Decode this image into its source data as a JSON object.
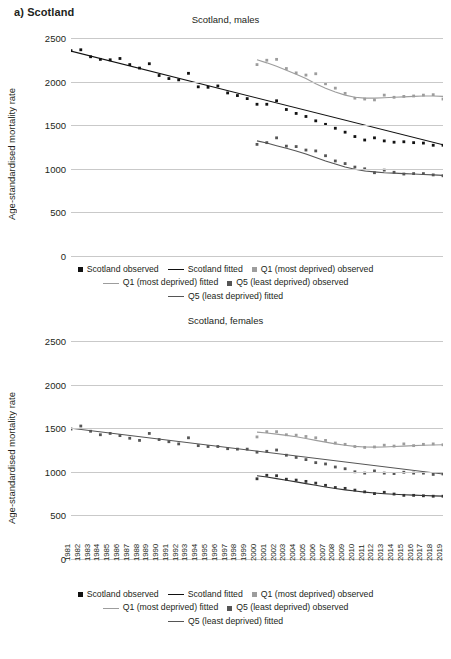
{
  "panel": {
    "label": "a) Scotland"
  },
  "colors": {
    "scotland": "#111111",
    "q1": "#9d9d9d",
    "q5": "#555555",
    "grid": "#c9c9c9",
    "text": "#231f20"
  },
  "axis": {
    "y_label": "Age-standardised mortality rate",
    "y_ticks": [
      "2500",
      "2000",
      "1500",
      "1000",
      "500",
      "0"
    ],
    "x_ticks": [
      "1981",
      "1982",
      "1983",
      "1984",
      "1985",
      "1986",
      "1987",
      "1988",
      "1989",
      "1990",
      "1991",
      "1992",
      "1993",
      "1994",
      "1995",
      "1996",
      "1997",
      "1998",
      "1999",
      "2000",
      "2001",
      "2002",
      "2003",
      "2004",
      "2005",
      "2006",
      "2007",
      "2008",
      "2009",
      "2010",
      "2011",
      "2012",
      "2013",
      "2014",
      "2015",
      "2016",
      "2017",
      "2018",
      "2019"
    ]
  },
  "legend": {
    "row1": [
      {
        "marker": "square",
        "series": "scotland",
        "label": "Scotland observed"
      },
      {
        "marker": "line",
        "series": "scotland",
        "label": "Scotland fitted"
      },
      {
        "marker": "square",
        "series": "q1",
        "label": "Q1 (most deprived) observed"
      }
    ],
    "row2": [
      {
        "marker": "line",
        "series": "q1",
        "label": "Q1 (most deprived) fitted"
      },
      {
        "marker": "square",
        "series": "q5",
        "label": "Q5 (least deprived) observed"
      }
    ],
    "row3": [
      {
        "marker": "line",
        "series": "q5",
        "label": "Q5 (least deprived) fitted"
      }
    ]
  },
  "chart_data": [
    {
      "type": "scatter",
      "id": "males",
      "title": "Scotland, males",
      "xlabel": "",
      "ylabel": "Age-standardised mortality rate",
      "ylim": [
        0,
        2500
      ],
      "grid": true,
      "legend_position": "below",
      "x": [
        1981,
        1982,
        1983,
        1984,
        1985,
        1986,
        1987,
        1988,
        1989,
        1990,
        1991,
        1992,
        1993,
        1994,
        1995,
        1996,
        1997,
        1998,
        1999,
        2000,
        2001,
        2002,
        2003,
        2004,
        2005,
        2006,
        2007,
        2008,
        2009,
        2010,
        2011,
        2012,
        2013,
        2014,
        2015,
        2016,
        2017,
        2018,
        2019
      ],
      "series": [
        {
          "name": "Scotland observed",
          "style": "points",
          "color": "#111111",
          "x": [
            1981,
            1982,
            1983,
            1984,
            1985,
            1986,
            1987,
            1988,
            1989,
            1990,
            1991,
            1992,
            1993,
            1994,
            1995,
            1996,
            1997,
            1998,
            1999,
            2000,
            2001,
            2002,
            2003,
            2004,
            2005,
            2006,
            2007,
            2008,
            2009,
            2010,
            2011,
            2012,
            2013,
            2014,
            2015,
            2016,
            2017,
            2018,
            2019
          ],
          "values": [
            2355,
            2365,
            2285,
            2255,
            2250,
            2265,
            2195,
            2155,
            2205,
            2070,
            2035,
            2020,
            2095,
            1940,
            1935,
            1950,
            1870,
            1840,
            1805,
            1740,
            1740,
            1780,
            1680,
            1635,
            1600,
            1550,
            1510,
            1465,
            1420,
            1370,
            1330,
            1355,
            1320,
            1305,
            1310,
            1300,
            1295,
            1270,
            1270
          ]
        },
        {
          "name": "Scotland fitted",
          "style": "line",
          "color": "#111111",
          "x": [
            1981,
            2019
          ],
          "values": [
            2350,
            1275
          ]
        },
        {
          "name": "Q1 (most deprived) observed",
          "style": "points",
          "color": "#9d9d9d",
          "x": [
            2000,
            2001,
            2002,
            2003,
            2004,
            2005,
            2006,
            2007,
            2008,
            2009,
            2010,
            2011,
            2012,
            2013,
            2014,
            2015,
            2016,
            2017,
            2018,
            2019
          ],
          "values": [
            2195,
            2245,
            2255,
            2150,
            2100,
            2075,
            2090,
            1975,
            1925,
            1865,
            1810,
            1800,
            1790,
            1845,
            1820,
            1830,
            1835,
            1845,
            1850,
            1800
          ]
        },
        {
          "name": "Q1 (most deprived) fitted",
          "style": "line",
          "color": "#9d9d9d",
          "x": [
            2000,
            2001,
            2002,
            2003,
            2004,
            2005,
            2006,
            2007,
            2008,
            2009,
            2010,
            2011,
            2012,
            2013,
            2014,
            2015,
            2016,
            2017,
            2018,
            2019
          ],
          "values": [
            2250,
            2215,
            2175,
            2130,
            2085,
            2035,
            1975,
            1925,
            1880,
            1845,
            1820,
            1810,
            1810,
            1815,
            1820,
            1825,
            1830,
            1835,
            1835,
            1830
          ]
        },
        {
          "name": "Q5 (least deprived) observed",
          "style": "points",
          "color": "#555555",
          "x": [
            2000,
            2001,
            2002,
            2003,
            2004,
            2005,
            2006,
            2007,
            2008,
            2009,
            2010,
            2011,
            2012,
            2013,
            2014,
            2015,
            2016,
            2017,
            2018,
            2019
          ],
          "values": [
            1280,
            1300,
            1355,
            1260,
            1255,
            1215,
            1205,
            1150,
            1090,
            1060,
            1020,
            1000,
            955,
            985,
            960,
            940,
            945,
            945,
            930,
            920
          ]
        },
        {
          "name": "Q5 (least deprived) fitted",
          "style": "line",
          "color": "#555555",
          "x": [
            2000,
            2001,
            2002,
            2003,
            2004,
            2005,
            2006,
            2007,
            2008,
            2009,
            2010,
            2011,
            2012,
            2013,
            2014,
            2015,
            2016,
            2017,
            2018,
            2019
          ],
          "values": [
            1320,
            1295,
            1265,
            1235,
            1205,
            1170,
            1130,
            1090,
            1055,
            1020,
            995,
            975,
            965,
            955,
            950,
            945,
            940,
            935,
            930,
            925
          ]
        }
      ]
    },
    {
      "type": "scatter",
      "id": "females",
      "title": "Scotland, females",
      "xlabel": "",
      "ylabel": "Age-standardised mortality rate",
      "ylim": [
        0,
        2500
      ],
      "grid": true,
      "legend_position": "below",
      "x": [
        1981,
        1982,
        1983,
        1984,
        1985,
        1986,
        1987,
        1988,
        1989,
        1990,
        1991,
        1992,
        1993,
        1994,
        1995,
        1996,
        1997,
        1998,
        1999,
        2000,
        2001,
        2002,
        2003,
        2004,
        2005,
        2006,
        2007,
        2008,
        2009,
        2010,
        2011,
        2012,
        2013,
        2014,
        2015,
        2016,
        2017,
        2018,
        2019
      ],
      "series": [
        {
          "name": "Scotland observed",
          "style": "points",
          "color": "#555555",
          "x": [
            1981,
            1982,
            1983,
            1984,
            1985,
            1986,
            1987,
            1988,
            1989,
            1990,
            1991,
            1992,
            1993,
            1994,
            1995,
            1996,
            1997,
            1998,
            1999,
            2000,
            2001,
            2002,
            2003,
            2004,
            2005,
            2006,
            2007,
            2008,
            2009,
            2010,
            2011,
            2012,
            2013,
            2014,
            2015,
            2016,
            2017,
            2018,
            2019
          ],
          "values": [
            1490,
            1525,
            1465,
            1425,
            1440,
            1415,
            1385,
            1360,
            1440,
            1370,
            1345,
            1320,
            1390,
            1300,
            1290,
            1290,
            1265,
            1260,
            1260,
            1225,
            1235,
            1250,
            1190,
            1165,
            1140,
            1105,
            1090,
            1055,
            1035,
            1000,
            985,
            1010,
            985,
            980,
            995,
            985,
            985,
            970,
            975
          ]
        },
        {
          "name": "Scotland fitted",
          "style": "line",
          "color": "#555555",
          "x": [
            1981,
            2019
          ],
          "values": [
            1500,
            975
          ]
        },
        {
          "name": "Q1 (most deprived) observed",
          "style": "points",
          "color": "#9d9d9d",
          "x": [
            2000,
            2001,
            2002,
            2003,
            2004,
            2005,
            2006,
            2007,
            2008,
            2009,
            2010,
            2011,
            2012,
            2013,
            2014,
            2015,
            2016,
            2017,
            2018,
            2019
          ],
          "values": [
            1400,
            1460,
            1460,
            1425,
            1420,
            1405,
            1390,
            1360,
            1330,
            1315,
            1290,
            1280,
            1285,
            1305,
            1295,
            1320,
            1300,
            1315,
            1320,
            1310
          ]
        },
        {
          "name": "Q1 (most deprived) fitted",
          "style": "line",
          "color": "#9d9d9d",
          "x": [
            2000,
            2001,
            2002,
            2003,
            2004,
            2005,
            2006,
            2007,
            2008,
            2009,
            2010,
            2011,
            2012,
            2013,
            2014,
            2015,
            2016,
            2017,
            2018,
            2019
          ],
          "values": [
            1455,
            1445,
            1432,
            1418,
            1402,
            1382,
            1360,
            1340,
            1320,
            1305,
            1292,
            1285,
            1283,
            1285,
            1290,
            1295,
            1300,
            1305,
            1308,
            1310
          ]
        },
        {
          "name": "Q5 (least deprived) observed",
          "style": "points",
          "color": "#333333",
          "x": [
            2000,
            2001,
            2002,
            2003,
            2004,
            2005,
            2006,
            2007,
            2008,
            2009,
            2010,
            2011,
            2012,
            2013,
            2014,
            2015,
            2016,
            2017,
            2018,
            2019
          ],
          "values": [
            920,
            960,
            955,
            915,
            905,
            890,
            870,
            845,
            820,
            810,
            790,
            770,
            750,
            765,
            745,
            730,
            730,
            725,
            720,
            720
          ]
        },
        {
          "name": "Q5 (least deprived) fitted",
          "style": "line",
          "color": "#333333",
          "x": [
            2000,
            2001,
            2002,
            2003,
            2004,
            2005,
            2006,
            2007,
            2008,
            2009,
            2010,
            2011,
            2012,
            2013,
            2014,
            2015,
            2016,
            2017,
            2018,
            2019
          ],
          "values": [
            955,
            940,
            922,
            903,
            884,
            864,
            845,
            826,
            809,
            793,
            779,
            767,
            757,
            749,
            742,
            737,
            732,
            728,
            724,
            721
          ]
        }
      ]
    }
  ]
}
